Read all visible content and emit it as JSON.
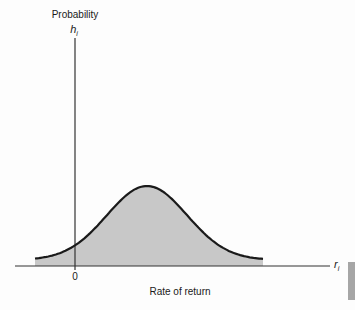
{
  "chart_data": {
    "type": "area",
    "title": "",
    "ylabel": "Probability",
    "ysymbol": "h",
    "ysymbol_sub": "i",
    "xlabel": "Rate of return",
    "xsymbol": "r",
    "xsymbol_sub": "i",
    "x_tick_labels": [
      "0"
    ],
    "xlim": [
      -1.0,
      5.5
    ],
    "ylim": [
      0,
      1.0
    ],
    "distribution": {
      "shape": "normal",
      "mean": 1.8,
      "std": 1.0,
      "peak": 1.0,
      "x_start": -1.0,
      "x_end": 4.7
    },
    "fill_color": "#c8c8c8",
    "curve_color": "#1a1a1a",
    "grid": false,
    "legend": "none"
  }
}
